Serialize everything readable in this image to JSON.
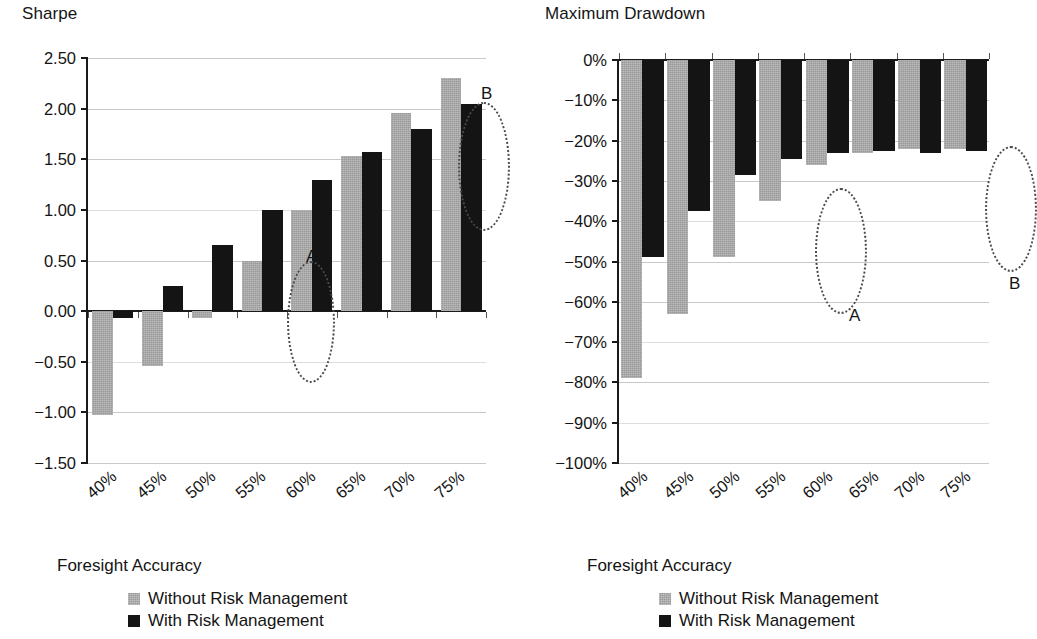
{
  "chart_data": [
    {
      "id": "sharpe",
      "type": "bar",
      "title": "Sharpe",
      "xlabel": "Foresight Accuracy",
      "ylabel": "Sharpe",
      "categories": [
        "40%",
        "45%",
        "50%",
        "55%",
        "60%",
        "65%",
        "70%",
        "75%"
      ],
      "ylim": [
        -1.5,
        2.5
      ],
      "yticks": [
        2.5,
        2.0,
        1.5,
        1.0,
        0.5,
        0.0,
        -0.5,
        -1.0,
        -1.5
      ],
      "ytick_labels": [
        "2.50",
        "2.00",
        "1.50",
        "1.00",
        "0.50",
        "0.00",
        "−0.50",
        "−1.00",
        "−1.50"
      ],
      "grid": true,
      "legend_position": "bottom",
      "series": [
        {
          "name": "Without Risk Management",
          "color": "#9a9a9a",
          "values": [
            -1.03,
            -0.54,
            -0.07,
            0.5,
            1.0,
            1.53,
            1.96,
            2.3
          ]
        },
        {
          "name": "With Risk Management",
          "color": "#141414",
          "values": [
            -0.07,
            0.25,
            0.65,
            1.0,
            1.3,
            1.57,
            1.8,
            2.05
          ]
        }
      ],
      "annotations": [
        {
          "label": "A",
          "target_category": "50%",
          "label_x": 218,
          "label_y": 190,
          "ellipse_x": 199,
          "ellipse_y": 203,
          "ellipse_w": 44,
          "ellipse_h": 118
        },
        {
          "label": "B",
          "target_category": "70%",
          "label_x": 393,
          "label_y": 27,
          "ellipse_x": 370,
          "ellipse_y": 44,
          "ellipse_w": 48,
          "ellipse_h": 125
        }
      ]
    },
    {
      "id": "max-drawdown",
      "type": "bar",
      "title": "Maximum Drawdown",
      "xlabel": "Foresight Accuracy",
      "ylabel": "Maximum Drawdown",
      "categories": [
        "40%",
        "45%",
        "50%",
        "55%",
        "60%",
        "65%",
        "70%",
        "75%"
      ],
      "ylim": [
        -100,
        0
      ],
      "yticks": [
        0,
        -10,
        -20,
        -30,
        -40,
        -50,
        -60,
        -70,
        -80,
        -90,
        -100
      ],
      "ytick_labels": [
        "0%",
        "−10%",
        "−20%",
        "−30%",
        "−40%",
        "−50%",
        "−60%",
        "−70%",
        "−80%",
        "−90%",
        "−100%"
      ],
      "grid": true,
      "legend_position": "bottom",
      "series": [
        {
          "name": "Without Risk Management",
          "color": "#9a9a9a",
          "values": [
            -79,
            -63,
            -49,
            -35,
            -26,
            -23,
            -22,
            -22
          ]
        },
        {
          "name": "With Risk Management",
          "color": "#141414",
          "values": [
            -49,
            -37.5,
            -28.5,
            -24.5,
            -23,
            -22.5,
            -23,
            -22.5
          ]
        }
      ],
      "annotations": [
        {
          "label": "A",
          "target_category": "50%",
          "label_x": 230,
          "label_y": 247,
          "ellipse_x": 196,
          "ellipse_y": 128,
          "ellipse_w": 48,
          "ellipse_h": 122
        },
        {
          "label": "B",
          "target_category": "70%",
          "label_x": 390,
          "label_y": 215,
          "ellipse_x": 366,
          "ellipse_y": 86,
          "ellipse_w": 48,
          "ellipse_h": 122
        }
      ]
    }
  ],
  "panels": [
    {
      "title": "Sharpe",
      "xlabel": "Foresight Accuracy",
      "legend": [
        {
          "label": "Without Risk Management",
          "swatch": "gray"
        },
        {
          "label": "With Risk Management",
          "swatch": "black"
        }
      ]
    },
    {
      "title": "Maximum Drawdown",
      "xlabel": "Foresight Accuracy",
      "legend": [
        {
          "label": "Without Risk Management",
          "swatch": "gray"
        },
        {
          "label": "With Risk Management",
          "swatch": "black"
        }
      ]
    }
  ]
}
